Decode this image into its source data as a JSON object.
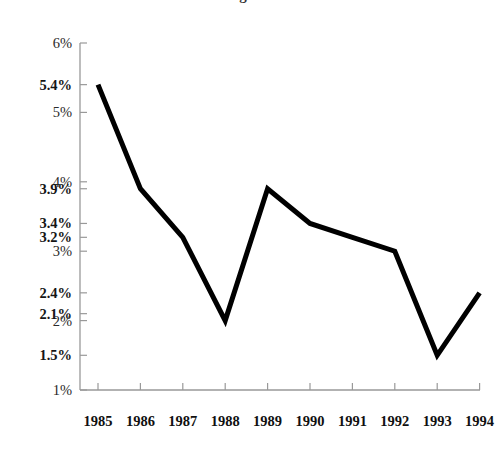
{
  "chart_data": {
    "type": "line",
    "title": "g",
    "categories": [
      "1985",
      "1986",
      "1987",
      "1988",
      "1989",
      "1990",
      "1991",
      "1992",
      "1993",
      "1994"
    ],
    "x": [
      1985,
      1986,
      1987,
      1988,
      1989,
      1990,
      1991,
      1992,
      1993,
      1994
    ],
    "values": [
      5.4,
      3.9,
      3.2,
      2.0,
      3.9,
      3.4,
      3.2,
      3.0,
      1.5,
      2.4
    ],
    "series": [
      {
        "name": "rate",
        "values": [
          5.4,
          3.9,
          3.2,
          2.0,
          3.9,
          3.4,
          3.2,
          3.0,
          1.5,
          2.4
        ]
      }
    ],
    "xlabel": "",
    "ylabel": "",
    "ylim": [
      1,
      6
    ],
    "xlim": [
      1985,
      1994
    ],
    "grid": false,
    "legend": false,
    "line_color": "#000000",
    "line_width": 5,
    "axis_color": "#999999",
    "y_ticks": [
      {
        "value": 6,
        "label": "6%",
        "emphasis": "minor"
      },
      {
        "value": 5.4,
        "label": "5.4%",
        "emphasis": "major"
      },
      {
        "value": 5,
        "label": "5%",
        "emphasis": "minor"
      },
      {
        "value": 4,
        "label": "4%",
        "emphasis": "minor"
      },
      {
        "value": 3.9,
        "label": "3.9%",
        "emphasis": "major"
      },
      {
        "value": 3.4,
        "label": "3.4%",
        "emphasis": "major"
      },
      {
        "value": 3.2,
        "label": "3.2%",
        "emphasis": "major"
      },
      {
        "value": 3,
        "label": "3%",
        "emphasis": "minor"
      },
      {
        "value": 2.4,
        "label": "2.4%",
        "emphasis": "major"
      },
      {
        "value": 2.1,
        "label": "2.1%",
        "emphasis": "major"
      },
      {
        "value": 2,
        "label": "2%",
        "emphasis": "minor"
      },
      {
        "value": 1.5,
        "label": "1.5%",
        "emphasis": "major"
      },
      {
        "value": 1,
        "label": "1%",
        "emphasis": "minor"
      }
    ],
    "x_ticks": [
      {
        "value": 1985,
        "label": "1985"
      },
      {
        "value": 1986,
        "label": "1986"
      },
      {
        "value": 1987,
        "label": "1987"
      },
      {
        "value": 1988,
        "label": "1988"
      },
      {
        "value": 1989,
        "label": "1989"
      },
      {
        "value": 1990,
        "label": "1990"
      },
      {
        "value": 1991,
        "label": "1991"
      },
      {
        "value": 1992,
        "label": "1992"
      },
      {
        "value": 1993,
        "label": "1993"
      },
      {
        "value": 1994,
        "label": "1994"
      }
    ],
    "geometry": {
      "plot_left": 80,
      "plot_right": 480,
      "plot_top": 43,
      "plot_bottom": 390,
      "first_point_x": 98,
      "point_spacing": 42.4,
      "tick_length": 7,
      "x_label_y": 414
    }
  }
}
